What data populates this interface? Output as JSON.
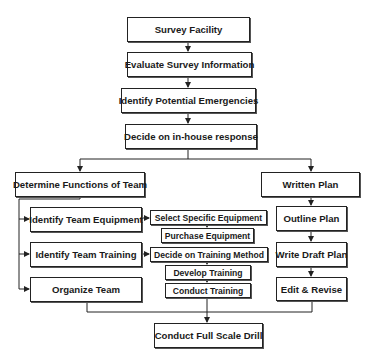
{
  "diagram": {
    "type": "flowchart",
    "colors": {
      "stroke": "#222222",
      "text": "#1a1a1a",
      "background": "#ffffff"
    },
    "nodes": {
      "survey_facility": "Survey Facility",
      "evaluate_survey": "Evaluate Survey Information",
      "identify_emergencies": "Identify Potential Emergencies",
      "decide_response": "Decide on in-house response",
      "determine_functions": "Determine Functions of Team",
      "written_plan": "Written Plan",
      "identify_equipment": "Identify Team Equipment",
      "select_equipment": "Select Specific Equipment",
      "purchase_equipment": "Purchase Equipment",
      "identify_training": "Identify Team Training",
      "decide_training_method": "Decide on Training Method",
      "develop_training": "Develop Training",
      "conduct_training": "Conduct Training",
      "organize_team": "Organize Team",
      "outline_plan": "Outline Plan",
      "write_draft_plan": "Write Draft Plan",
      "edit_revise": "Edit & Revise",
      "full_scale_drill": "Conduct Full Scale Drill"
    },
    "edges": [
      [
        "survey_facility",
        "evaluate_survey"
      ],
      [
        "evaluate_survey",
        "identify_emergencies"
      ],
      [
        "identify_emergencies",
        "decide_response"
      ],
      [
        "decide_response",
        "determine_functions"
      ],
      [
        "decide_response",
        "written_plan"
      ],
      [
        "determine_functions",
        "identify_equipment"
      ],
      [
        "determine_functions",
        "identify_training"
      ],
      [
        "determine_functions",
        "organize_team"
      ],
      [
        "identify_equipment",
        "select_equipment"
      ],
      [
        "select_equipment",
        "purchase_equipment"
      ],
      [
        "identify_training",
        "decide_training_method"
      ],
      [
        "decide_training_method",
        "develop_training"
      ],
      [
        "develop_training",
        "conduct_training"
      ],
      [
        "written_plan",
        "outline_plan"
      ],
      [
        "outline_plan",
        "write_draft_plan"
      ],
      [
        "write_draft_plan",
        "edit_revise"
      ],
      [
        "organize_team",
        "full_scale_drill"
      ],
      [
        "conduct_training",
        "full_scale_drill"
      ],
      [
        "edit_revise",
        "full_scale_drill"
      ]
    ]
  }
}
